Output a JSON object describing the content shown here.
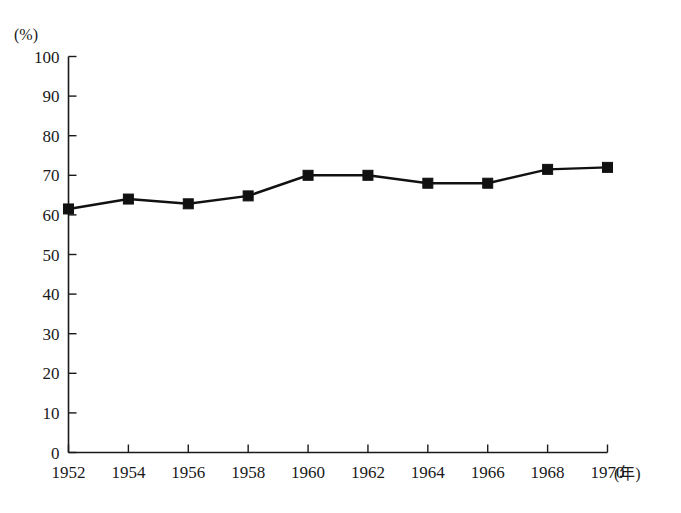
{
  "chart_data": {
    "type": "line",
    "title": "",
    "subtitle": "",
    "xlabel": "(年)",
    "ylabel": "(%)",
    "x": [
      1952,
      1954,
      1956,
      1958,
      1960,
      1962,
      1964,
      1966,
      1968,
      1970
    ],
    "categories": [
      "1952",
      "1954",
      "1956",
      "1958",
      "1960",
      "1962",
      "1964",
      "1966",
      "1968",
      "1970"
    ],
    "values": [
      61.5,
      64,
      62.8,
      64.8,
      70,
      70,
      68,
      68,
      71.5,
      72
    ],
    "series": [
      {
        "name": "",
        "values": [
          61.5,
          64,
          62.8,
          64.8,
          70,
          70,
          68,
          68,
          71.5,
          72
        ]
      }
    ],
    "xlim": [
      1952,
      1970
    ],
    "ylim": [
      0,
      100
    ],
    "ytick_labels": [
      "0",
      "10",
      "20",
      "30",
      "40",
      "50",
      "60",
      "70",
      "80",
      "90",
      "100"
    ],
    "ytick_values": [
      0,
      10,
      20,
      30,
      40,
      50,
      60,
      70,
      80,
      90,
      100
    ],
    "xtick_labels": [
      "1952",
      "1954",
      "1956",
      "1958",
      "1960",
      "1962",
      "1964",
      "1966",
      "1968",
      "1970"
    ],
    "grid": false,
    "legend": "none",
    "marker": "square",
    "line_color": "#111111",
    "marker_color": "#111111",
    "axis_color": "#1a1a1a"
  },
  "axes": {
    "y_unit_label": "(%)",
    "x_unit_label": "(年)"
  }
}
